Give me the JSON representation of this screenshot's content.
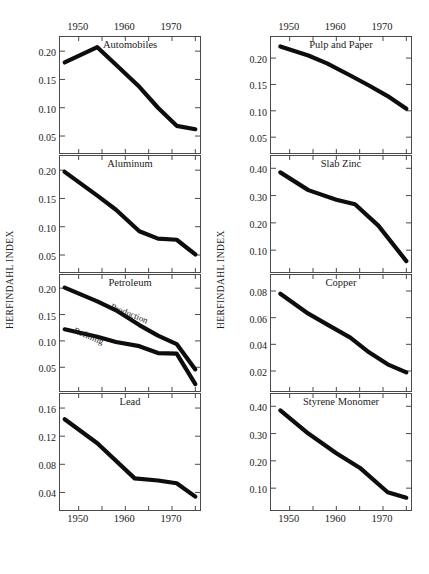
{
  "figure": {
    "y_axis_label": "HERFINDAHL INDEX",
    "x_tick_years": [
      "1950",
      "1960",
      "1970"
    ],
    "caption": ""
  },
  "chart_data": [
    {
      "type": "line",
      "title": "Automobiles",
      "xlabel": "",
      "ylabel": "HERFINDAHL INDEX",
      "xlim": [
        1946,
        1976
      ],
      "ylim": [
        0.02,
        0.225
      ],
      "yticks": [
        0.05,
        0.1,
        0.15,
        0.2
      ],
      "ytick_labels": [
        "0.05",
        "0.10",
        "0.15",
        "0.20"
      ],
      "grid": false,
      "series": [
        {
          "name": "Automobiles",
          "x": [
            1947,
            1954,
            1958,
            1963,
            1967,
            1971,
            1975
          ],
          "values": [
            0.18,
            0.207,
            0.176,
            0.137,
            0.1,
            0.068,
            0.062
          ]
        }
      ]
    },
    {
      "type": "line",
      "title": "Aluminum",
      "xlabel": "",
      "ylabel": "HERFINDAHL INDEX",
      "xlim": [
        1946,
        1976
      ],
      "ylim": [
        0.02,
        0.225
      ],
      "yticks": [
        0.05,
        0.1,
        0.15,
        0.2
      ],
      "ytick_labels": [
        "0.05",
        "0.10",
        "0.15",
        "0.20"
      ],
      "grid": false,
      "series": [
        {
          "name": "Aluminum",
          "x": [
            1947,
            1954,
            1958,
            1963,
            1967,
            1971,
            1975
          ],
          "values": [
            0.197,
            0.155,
            0.13,
            0.092,
            0.079,
            0.077,
            0.051
          ]
        }
      ]
    },
    {
      "type": "line",
      "title": "Petroleum",
      "xlabel": "",
      "ylabel": "HERFINDAHL INDEX",
      "xlim": [
        1946,
        1976
      ],
      "ylim": [
        0.005,
        0.225
      ],
      "yticks": [
        0.05,
        0.1,
        0.15,
        0.2
      ],
      "ytick_labels": [
        "0.05",
        "0.10",
        "0.15",
        "0.20"
      ],
      "grid": false,
      "series": [
        {
          "name": "Production",
          "x": [
            1947,
            1954,
            1958,
            1963,
            1967,
            1971,
            1975
          ],
          "values": [
            0.201,
            0.175,
            0.158,
            0.13,
            0.11,
            0.094,
            0.046
          ]
        },
        {
          "name": "Refining",
          "x": [
            1947,
            1954,
            1958,
            1963,
            1967,
            1971,
            1975
          ],
          "values": [
            0.122,
            0.108,
            0.098,
            0.09,
            0.077,
            0.076,
            0.018
          ]
        }
      ]
    },
    {
      "type": "line",
      "title": "Lead",
      "xlabel": "",
      "ylabel": "HERFINDAHL INDEX",
      "xlim": [
        1946,
        1976
      ],
      "ylim": [
        0.015,
        0.18
      ],
      "yticks": [
        0.04,
        0.08,
        0.12,
        0.16
      ],
      "ytick_labels": [
        "0.04",
        "0.08",
        "0.12",
        "0.16"
      ],
      "grid": false,
      "series": [
        {
          "name": "Lead",
          "x": [
            1947,
            1954,
            1962,
            1967,
            1971,
            1975
          ],
          "values": [
            0.144,
            0.11,
            0.06,
            0.057,
            0.053,
            0.034
          ]
        }
      ]
    },
    {
      "type": "line",
      "title": "Pulp and Paper",
      "xlabel": "",
      "ylabel": "HERFINDAHL INDEX",
      "xlim": [
        1946,
        1976
      ],
      "ylim": [
        0.02,
        0.24
      ],
      "yticks": [
        0.05,
        0.1,
        0.15,
        0.2
      ],
      "ytick_labels": [
        "0.05",
        "0.10",
        "0.15",
        "0.20"
      ],
      "grid": false,
      "series": [
        {
          "name": "Pulp and Paper",
          "x": [
            1948,
            1954,
            1958,
            1963,
            1967,
            1971,
            1975
          ],
          "values": [
            0.222,
            0.205,
            0.19,
            0.167,
            0.148,
            0.128,
            0.104
          ]
        }
      ]
    },
    {
      "type": "line",
      "title": "Slab Zinc",
      "xlabel": "",
      "ylabel": "HERFINDAHL INDEX",
      "xlim": [
        1946,
        1976
      ],
      "ylim": [
        0.02,
        0.445
      ],
      "yticks": [
        0.1,
        0.2,
        0.3,
        0.4
      ],
      "ytick_labels": [
        "0.10",
        "0.20",
        "0.30",
        "0.40"
      ],
      "grid": false,
      "series": [
        {
          "name": "Slab Zinc",
          "x": [
            1948,
            1954,
            1960,
            1964,
            1969,
            1975
          ],
          "values": [
            0.385,
            0.32,
            0.285,
            0.268,
            0.19,
            0.06
          ]
        }
      ]
    },
    {
      "type": "line",
      "title": "Copper",
      "xlabel": "",
      "ylabel": "HERFINDAHL INDEX",
      "xlim": [
        1946,
        1976
      ],
      "ylim": [
        0.005,
        0.092
      ],
      "yticks": [
        0.02,
        0.04,
        0.06,
        0.08
      ],
      "ytick_labels": [
        "0.02",
        "0.04",
        "0.06",
        "0.08"
      ],
      "grid": false,
      "series": [
        {
          "name": "Copper",
          "x": [
            1948,
            1954,
            1958,
            1963,
            1967,
            1971,
            1975
          ],
          "values": [
            0.078,
            0.063,
            0.055,
            0.045,
            0.034,
            0.025,
            0.019
          ]
        }
      ]
    },
    {
      "type": "line",
      "title": "Styrene Monomer",
      "xlabel": "",
      "ylabel": "HERFINDAHL INDEX",
      "xlim": [
        1946,
        1976
      ],
      "ylim": [
        0.02,
        0.445
      ],
      "yticks": [
        0.1,
        0.2,
        0.3,
        0.4
      ],
      "ytick_labels": [
        "0.10",
        "0.20",
        "0.30",
        "0.40"
      ],
      "grid": false,
      "series": [
        {
          "name": "Styrene Monomer",
          "x": [
            1948,
            1954,
            1960,
            1965,
            1971,
            1975
          ],
          "values": [
            0.385,
            0.3,
            0.228,
            0.175,
            0.085,
            0.065
          ]
        }
      ]
    }
  ]
}
